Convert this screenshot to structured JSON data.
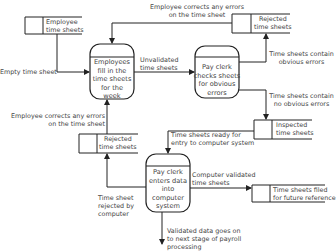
{
  "diagram": {
    "type": "data-flow-diagram",
    "colors": {
      "line": "#222222",
      "text": "#444444",
      "background": "#ffffff"
    },
    "processes": [
      {
        "id": "p1",
        "label": "Employees fill in the time sheets for the week",
        "lines": [
          "Employees",
          "fill in the",
          "time sheets",
          "for the",
          "week"
        ]
      },
      {
        "id": "p2",
        "label": "Pay clerk checks sheets for obvious errors",
        "lines": [
          "Pay clerk",
          "checks sheets",
          "for obvious",
          "errors"
        ]
      },
      {
        "id": "p3",
        "label": "Pay clerk enters data into computer system",
        "lines": [
          "Pay clerk",
          "enters data",
          "into",
          "computer",
          "system"
        ]
      }
    ],
    "stores": [
      {
        "id": "s1",
        "lines": [
          "Employee",
          "time sheets"
        ]
      },
      {
        "id": "s2",
        "lines": [
          "Rejected",
          "time sheets"
        ]
      },
      {
        "id": "s3",
        "lines": [
          "Inspected",
          "time sheets"
        ]
      },
      {
        "id": "s4",
        "lines": [
          "Rejected",
          "time sheets"
        ]
      },
      {
        "id": "s5",
        "lines": [
          "Time sheets filed",
          "for future reference"
        ]
      }
    ],
    "flows": [
      {
        "id": "f1",
        "lines": [
          "Empty time sheet"
        ]
      },
      {
        "id": "f2",
        "lines": [
          "Employee corrects any errors",
          "on the time sheet"
        ]
      },
      {
        "id": "f3",
        "lines": [
          "Unvalidated",
          "time sheets"
        ]
      },
      {
        "id": "f4",
        "lines": [
          "Time sheets contain",
          "obvious errors"
        ]
      },
      {
        "id": "f5",
        "lines": [
          "Time sheets contain",
          "no obvious errors"
        ]
      },
      {
        "id": "f6",
        "lines": [
          "Employee corrects any errors",
          "on the time sheet"
        ]
      },
      {
        "id": "f7",
        "lines": [
          "Time sheets ready for",
          "entry to computer system"
        ]
      },
      {
        "id": "f8",
        "lines": [
          "Computer validated",
          "time sheets"
        ]
      },
      {
        "id": "f9",
        "lines": [
          "Time sheet",
          "rejected by",
          "computer"
        ]
      },
      {
        "id": "f10",
        "lines": [
          "Validated data goes on",
          "to next stage of payroll",
          "processing"
        ]
      }
    ]
  }
}
